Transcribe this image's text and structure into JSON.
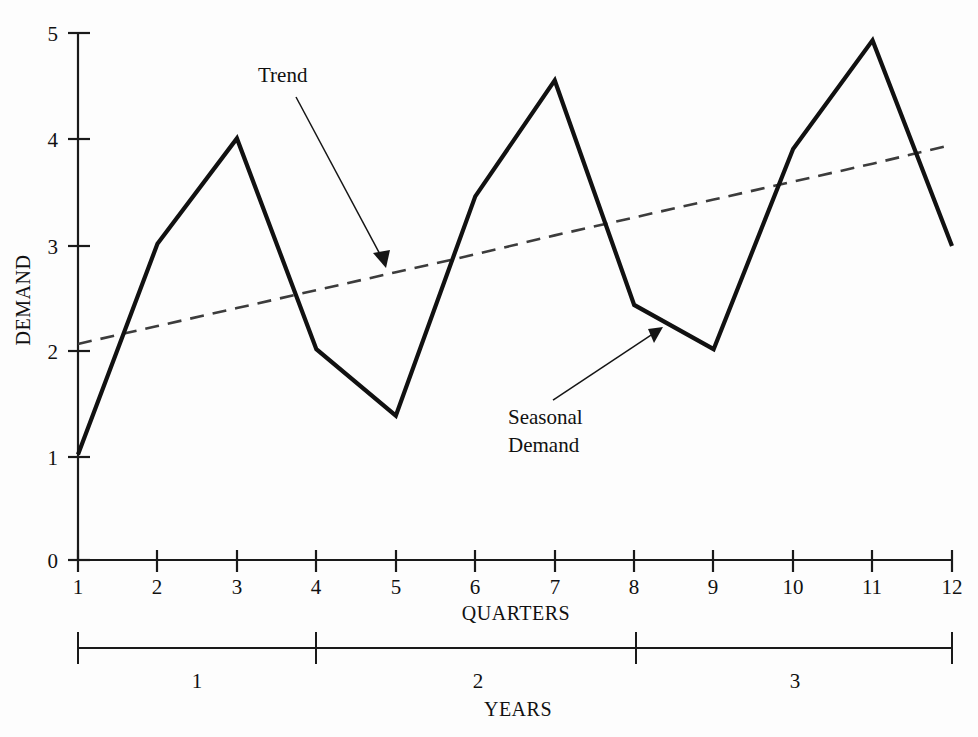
{
  "chart_data": {
    "type": "line",
    "title": "",
    "xlabel": "QUARTERS",
    "ylabel": "DEMAND",
    "secondary_xlabel": "YEARS",
    "xlim": [
      1,
      12
    ],
    "ylim": [
      0,
      5
    ],
    "x_ticklabels": [
      "1",
      "2",
      "3",
      "4",
      "5",
      "6",
      "7",
      "8",
      "9",
      "10",
      "11",
      "12"
    ],
    "y_ticklabels": [
      "0",
      "1",
      "2",
      "3",
      "4",
      "5"
    ],
    "y_ticks": [
      0,
      1,
      2,
      3,
      4,
      5
    ],
    "grid": false,
    "legend": "none",
    "x": [
      1,
      2,
      3,
      4,
      5,
      6,
      7,
      8,
      9,
      10,
      11,
      12
    ],
    "series": [
      {
        "name": "Seasonal Demand",
        "style": "solid",
        "color": "#111111",
        "values": [
          1.0,
          3.0,
          4.0,
          2.0,
          1.37,
          3.45,
          4.55,
          2.42,
          2.0,
          3.9,
          4.93,
          2.98
        ]
      },
      {
        "name": "Trend",
        "style": "dashed",
        "color": "#3c3c3c",
        "values": [
          2.05,
          2.22,
          2.39,
          2.56,
          2.73,
          2.9,
          3.08,
          3.25,
          3.42,
          3.59,
          3.76,
          3.94
        ]
      }
    ],
    "annotations": [
      {
        "label": "Trend",
        "lines": [
          "Trend"
        ],
        "points_to_series": "Trend",
        "points_to_x": 4.9,
        "points_to_y": 2.78
      },
      {
        "label": "Seasonal Demand",
        "lines": [
          "Seasonal",
          "Demand"
        ],
        "points_to_series": "Seasonal Demand",
        "points_to_x": 8.3,
        "points_to_y": 2.3
      }
    ],
    "year_axis": {
      "label": "YEARS",
      "segments": [
        {
          "label": "1",
          "from_quarter": 1,
          "to_quarter": 4
        },
        {
          "label": "2",
          "from_quarter": 4,
          "to_quarter": 8
        },
        {
          "label": "3",
          "from_quarter": 8,
          "to_quarter": 12
        }
      ]
    }
  }
}
